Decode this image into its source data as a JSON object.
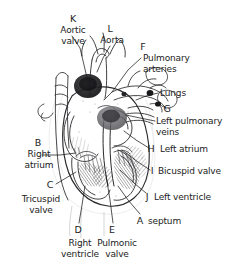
{
  "figure": {
    "medium": "pen-and-ink anatomical line drawing",
    "background_color": "#ffffff",
    "ink_color": "#1c1c1c",
    "width": 245,
    "height": 271
  },
  "labels": [
    {
      "key": "K",
      "name": "aortic-valve",
      "lines": [
        "Aortic",
        "valve"
      ],
      "key_x": 73,
      "key_y": 14,
      "text_x": 50,
      "text_y": 25,
      "text_w": 46,
      "align": "center",
      "leader": [
        [
          72,
          36
        ],
        [
          80,
          48
        ],
        [
          88,
          82
        ]
      ]
    },
    {
      "key": "L",
      "name": "aorta",
      "lines": [
        "Aorta"
      ],
      "key_x": 110,
      "key_y": 24,
      "text_x": 90,
      "text_y": 35,
      "text_w": 44,
      "align": "center",
      "leader": [
        [
          110,
          46
        ],
        [
          103,
          58
        ],
        [
          97,
          72
        ]
      ]
    },
    {
      "key": "F",
      "name": "pulmonary-arteries",
      "lines": [
        "Pulmonary",
        "arteries"
      ],
      "key_x": 143,
      "key_y": 42,
      "text_x": 143,
      "text_y": 53,
      "text_w": 60,
      "align": "left",
      "leader": [
        [
          141,
          58
        ],
        [
          128,
          70
        ],
        [
          112,
          92
        ],
        [
          104,
          100
        ]
      ]
    },
    {
      "key": "",
      "name": "lungs",
      "lines": [
        "Lungs"
      ],
      "key_x": 0,
      "key_y": 0,
      "text_x": 160,
      "text_y": 88,
      "text_w": 40,
      "align": "left",
      "leader": [
        [
          158,
          93
        ],
        [
          146,
          96
        ],
        [
          136,
          100
        ]
      ]
    },
    {
      "key": "G",
      "name": "left-pulmonary-veins",
      "lines": [
        "Left pulmonary",
        "veins"
      ],
      "key_x": 167,
      "key_y": 104,
      "text_x": 156,
      "text_y": 116,
      "text_w": 88,
      "align": "left",
      "leader": [
        [
          155,
          121
        ],
        [
          140,
          118
        ],
        [
          126,
          115
        ]
      ]
    },
    {
      "key": "H",
      "name": "left-atrium",
      "lines": [
        "Left atrium"
      ],
      "key_x": 151,
      "key_y": 144,
      "text_x": 160,
      "text_y": 144,
      "text_w": 60,
      "align": "left",
      "leader": [
        [
          149,
          148
        ],
        [
          136,
          140
        ],
        [
          124,
          131
        ]
      ]
    },
    {
      "key": "I",
      "name": "bicuspid-valve",
      "lines": [
        "Bicuspid valve"
      ],
      "key_x": 152,
      "key_y": 166,
      "text_x": 158,
      "text_y": 166,
      "text_w": 78,
      "align": "left",
      "leader": [
        [
          150,
          170
        ],
        [
          138,
          162
        ],
        [
          122,
          150
        ]
      ]
    },
    {
      "key": "J",
      "name": "left-ventricle",
      "lines": [
        "Left ventricle"
      ],
      "key_x": 147,
      "key_y": 192,
      "text_x": 154,
      "text_y": 192,
      "text_w": 72,
      "align": "left",
      "leader": [
        [
          146,
          193
        ],
        [
          134,
          183
        ],
        [
          120,
          170
        ]
      ]
    },
    {
      "key": "A",
      "name": "septum",
      "lines": [
        "septum"
      ],
      "key_x": 140,
      "key_y": 216,
      "text_x": 148,
      "text_y": 216,
      "text_w": 44,
      "align": "left",
      "leader": [
        [
          140,
          214
        ],
        [
          128,
          200
        ],
        [
          118,
          186
        ]
      ]
    },
    {
      "key": "E",
      "name": "pulmonic-valve",
      "lines": [
        "Pulmonic",
        "valve"
      ],
      "key_x": 112,
      "key_y": 225,
      "text_x": 90,
      "text_y": 238,
      "text_w": 54,
      "align": "center",
      "leader": [
        [
          113,
          223
        ],
        [
          110,
          200
        ],
        [
          106,
          175
        ]
      ]
    },
    {
      "key": "D",
      "name": "right-ventricle",
      "lines": [
        "Right",
        "ventricle"
      ],
      "key_x": 78,
      "key_y": 225,
      "text_x": 54,
      "text_y": 238,
      "text_w": 52,
      "align": "center",
      "leader": [
        [
          79,
          223
        ],
        [
          82,
          205
        ],
        [
          85,
          186
        ]
      ]
    },
    {
      "key": "C",
      "name": "tricuspid-valve",
      "lines": [
        "Tricuspid",
        "valve"
      ],
      "key_x": 50,
      "key_y": 180,
      "text_x": 12,
      "text_y": 194,
      "text_w": 58,
      "align": "center",
      "leader": [
        [
          56,
          184
        ],
        [
          66,
          178
        ],
        [
          76,
          172
        ]
      ]
    },
    {
      "key": "B",
      "name": "right-atrium",
      "lines": [
        "Right",
        "atrium"
      ],
      "key_x": 38,
      "key_y": 138,
      "text_x": 12,
      "text_y": 149,
      "text_w": 54,
      "align": "center",
      "leader": [
        [
          42,
          155
        ],
        [
          60,
          155
        ],
        [
          76,
          153
        ]
      ]
    }
  ],
  "structures": [
    "aorta",
    "aortic valve",
    "pulmonary arteries",
    "lungs",
    "left pulmonary veins",
    "left atrium",
    "bicuspid valve",
    "left ventricle",
    "septum",
    "pulmonic valve",
    "right ventricle",
    "tricuspid valve",
    "right atrium"
  ]
}
